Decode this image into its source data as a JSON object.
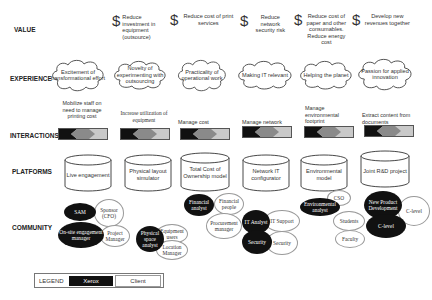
{
  "rows": {
    "value": "VALUE",
    "experience": "EXPERIENCE",
    "interactions": "INTERACTIONS",
    "platforms": "PLATFORMS",
    "community": "COMMUNITY"
  },
  "value_icon": "dollar-icon",
  "values": [
    {
      "text": "Reduce investment in equipment (outsource)"
    },
    {
      "text": "Reduce cost of print services"
    },
    {
      "text": "Reduce network security risk"
    },
    {
      "text": "Reduce cost of paper and other consumables. Reduce energy cost"
    },
    {
      "text": "Develop new revenues together"
    }
  ],
  "experiences": [
    {
      "text": "Excitement of transformational effort"
    },
    {
      "text": "Novelty of experimenting with outsourcing"
    },
    {
      "text": "Practicality of operational work"
    },
    {
      "text": "Making IT relevant"
    },
    {
      "text": "Helping the planet"
    },
    {
      "text": "Passion for applied innovation"
    }
  ],
  "interactions": [
    {
      "text": "Mobilize staff on need to manage printing cost"
    },
    {
      "text": "Increase utilization of equipment"
    },
    {
      "text": "Manage cost"
    },
    {
      "text": "Manage network"
    },
    {
      "text": "Manage environmental footprint"
    },
    {
      "text": "Extract content from documents"
    }
  ],
  "platforms": [
    {
      "text": "Live engagement"
    },
    {
      "text": "Physical layout simulator"
    },
    {
      "text": "Total Cost of Ownership model"
    },
    {
      "text": "Network IT configurator"
    },
    {
      "text": "Environmental model"
    },
    {
      "text": "Joint R&D project"
    }
  ],
  "community": {
    "group1": {
      "xerox": [
        "SAM",
        "On-site engagement manager"
      ],
      "client": [
        "Sponsor (CFO)",
        "Project Manager"
      ]
    },
    "group2": {
      "xerox": [
        "Physical space analyst"
      ],
      "client": [
        "Equipment users",
        "Location Manager"
      ]
    },
    "group3": {
      "xerox": [
        "Financial analyst"
      ],
      "client": [
        "Financial people",
        "Procurement manager"
      ]
    },
    "group4": {
      "xerox": [
        "IT Analyst",
        "Security"
      ],
      "client": [
        "IT Support",
        "Security"
      ]
    },
    "group5": {
      "xerox": [
        "Environmental analyst"
      ],
      "client": [
        "CSO",
        "Students",
        "Faculty"
      ]
    },
    "group6": {
      "xerox": [
        "New Product Development",
        "C-level"
      ],
      "client": [
        "C-level"
      ]
    }
  },
  "legend": {
    "label": "LEGEND",
    "xerox": "Xerox",
    "client": "Client"
  },
  "colors": {
    "xerox": "#111111",
    "client": "#ffffff",
    "bar_dark": "#111111",
    "bar_mid": "#888888",
    "bar_light": "#c9c9c9"
  }
}
